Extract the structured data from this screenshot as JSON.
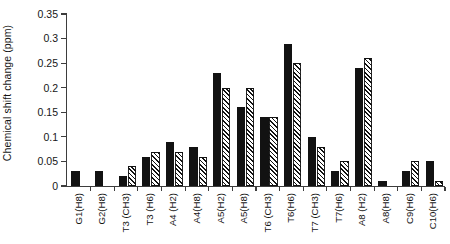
{
  "chart_data": {
    "type": "bar",
    "title": "",
    "subtitle": "",
    "xlabel": "",
    "ylabel": "Chemical shift change (ppm)",
    "ylim": [
      0,
      0.35
    ],
    "yticks": [
      0,
      0.05,
      0.1,
      0.15,
      0.2,
      0.25,
      0.3,
      0.35
    ],
    "ytick_labels": [
      "0",
      "0.05",
      "0.1",
      "0.15",
      "0.2",
      "0.25",
      "0.3",
      "0.35"
    ],
    "grid": false,
    "legend": "none",
    "categories": [
      "G1(H8)",
      "G2(H8)",
      "T3 (CH3)",
      "T3 (H6)",
      "A4 (H2)",
      "A4(H8)",
      "A5(H2)",
      "A5(H8)",
      "T6 (CH3)",
      "T6(H6)",
      "T7 (CH3)",
      "T7(H6)",
      "A8 (H2)",
      "A8(H8)",
      "C9(H6)",
      "C10(H6)"
    ],
    "series": [
      {
        "name": "solid-black-series",
        "fill": "solid",
        "color": "#121212",
        "values": [
          0.03,
          0.03,
          0.02,
          0.06,
          0.09,
          0.08,
          0.23,
          0.16,
          0.14,
          0.29,
          0.1,
          0.03,
          0.24,
          0.01,
          0.03,
          0.05
        ]
      },
      {
        "name": "diagonal-hatched-series",
        "fill": "diagonal-hatch",
        "color": "#121212",
        "values": [
          0.0,
          0.0,
          0.04,
          0.07,
          0.07,
          0.06,
          0.2,
          0.2,
          0.14,
          0.25,
          0.08,
          0.05,
          0.26,
          0.0,
          0.05,
          0.01
        ]
      }
    ]
  }
}
